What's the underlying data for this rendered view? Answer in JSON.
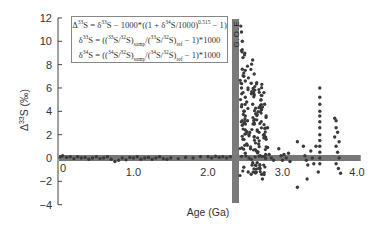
{
  "chart_data": {
    "type": "scatter",
    "title": "",
    "xlabel": "Age (Ga)",
    "ylabel": "Δ33S (‰)",
    "xlim": [
      0,
      4.0
    ],
    "ylim": [
      -4,
      12
    ],
    "x_ticks": [
      0,
      1.0,
      2.0,
      3.0
    ],
    "x_tick_labels": [
      "0",
      "1.0",
      "2.0",
      "3.0",
      "4.0"
    ],
    "x_tick_label_positions": [
      0,
      1.0,
      2.0,
      3.0,
      4.0
    ],
    "y_ticks": [
      12,
      10,
      8,
      6,
      4,
      2,
      0,
      -2,
      -4
    ],
    "y_tick_labels": [
      "12",
      "10",
      "8",
      "6",
      "4",
      "2",
      "0",
      "−2",
      "−4"
    ],
    "grid": false,
    "legend": null,
    "annotations": [
      {
        "type": "vertical_band",
        "label": "G.O.E",
        "x_start": 2.33,
        "x_end": 2.42,
        "y_start": 12.0,
        "y_end": -3.8,
        "color": "#7a7a7a"
      },
      {
        "type": "horizontal_band",
        "label": "mass-dependent range",
        "x_start": 0,
        "x_end": 4.05,
        "y_center": 0,
        "thickness": 0.5,
        "color": "#777777"
      }
    ],
    "formulas": [
      "Δ33S = δ33S − 1000*((1 + δ34S/1000)^0.515 − 1)",
      "δ33S = ((33S/32S)samp/(33S/32S)ref − 1)*1000",
      "δ34S = ((34S/32S)samp/(34S/32S)ref − 1)*1000"
    ],
    "series": [
      {
        "name": "Δ33S measurements",
        "color": "#3a3a3a",
        "points": [
          [
            0.02,
            0.1
          ],
          [
            0.05,
            0.2
          ],
          [
            0.1,
            0.05
          ],
          [
            0.15,
            0.1
          ],
          [
            0.2,
            -0.05
          ],
          [
            0.25,
            0.1
          ],
          [
            0.3,
            0.0
          ],
          [
            0.35,
            0.05
          ],
          [
            0.4,
            -0.1
          ],
          [
            0.45,
            0.0
          ],
          [
            0.5,
            0.1
          ],
          [
            0.55,
            -0.05
          ],
          [
            0.6,
            0.0
          ],
          [
            0.65,
            0.1
          ],
          [
            0.7,
            -0.1
          ],
          [
            0.75,
            -0.3
          ],
          [
            0.8,
            -0.2
          ],
          [
            0.85,
            0.0
          ],
          [
            0.9,
            -0.15
          ],
          [
            0.95,
            0.05
          ],
          [
            1.0,
            0.0
          ],
          [
            1.05,
            0.1
          ],
          [
            1.1,
            -0.1
          ],
          [
            1.15,
            0.0
          ],
          [
            1.2,
            0.05
          ],
          [
            1.25,
            -0.1
          ],
          [
            1.3,
            0.0
          ],
          [
            1.35,
            0.1
          ],
          [
            1.4,
            -0.05
          ],
          [
            1.45,
            -0.1
          ],
          [
            1.5,
            0.0
          ],
          [
            1.6,
            -0.05
          ],
          [
            1.7,
            0.05
          ],
          [
            1.8,
            0.0
          ],
          [
            1.9,
            0.1
          ],
          [
            2.0,
            0.1
          ],
          [
            2.05,
            0.0
          ],
          [
            2.1,
            0.15
          ],
          [
            2.15,
            0.05
          ],
          [
            2.2,
            0.1
          ],
          [
            2.25,
            0.0
          ],
          [
            2.3,
            0.1
          ],
          [
            2.44,
            11.3
          ],
          [
            2.45,
            10.8
          ],
          [
            2.46,
            10.0
          ],
          [
            2.45,
            9.2
          ],
          [
            2.47,
            8.6
          ],
          [
            2.46,
            7.6
          ],
          [
            2.48,
            7.0
          ],
          [
            2.5,
            6.6
          ],
          [
            2.45,
            6.0
          ],
          [
            2.47,
            5.6
          ],
          [
            2.5,
            5.2
          ],
          [
            2.52,
            4.8
          ],
          [
            2.45,
            4.4
          ],
          [
            2.48,
            4.0
          ],
          [
            2.5,
            3.6
          ],
          [
            2.53,
            3.2
          ],
          [
            2.46,
            2.8
          ],
          [
            2.5,
            2.4
          ],
          [
            2.55,
            2.0
          ],
          [
            2.47,
            1.6
          ],
          [
            2.52,
            1.2
          ],
          [
            2.57,
            0.8
          ],
          [
            2.5,
            0.4
          ],
          [
            2.55,
            0.0
          ],
          [
            2.6,
            -0.4
          ],
          [
            2.48,
            -0.8
          ],
          [
            2.54,
            -1.2
          ],
          [
            2.58,
            -1.4
          ],
          [
            2.6,
            8.4
          ],
          [
            2.62,
            7.2
          ],
          [
            2.58,
            6.4
          ],
          [
            2.62,
            5.4
          ],
          [
            2.6,
            4.6
          ],
          [
            2.64,
            3.8
          ],
          [
            2.62,
            3.0
          ],
          [
            2.66,
            2.4
          ],
          [
            2.62,
            1.8
          ],
          [
            2.68,
            1.2
          ],
          [
            2.65,
            0.6
          ],
          [
            2.7,
            0.2
          ],
          [
            2.66,
            -0.4
          ],
          [
            2.7,
            -0.9
          ],
          [
            2.72,
            -1.4
          ],
          [
            2.73,
            -1.8
          ],
          [
            2.75,
            5.6
          ],
          [
            2.76,
            4.6
          ],
          [
            2.78,
            3.6
          ],
          [
            2.8,
            2.6
          ],
          [
            2.78,
            1.6
          ],
          [
            2.8,
            0.9
          ],
          [
            2.82,
            0.3
          ],
          [
            2.85,
            0.0
          ],
          [
            2.88,
            -0.2
          ],
          [
            2.95,
            0.8
          ],
          [
            2.98,
            0.2
          ],
          [
            3.0,
            -0.2
          ],
          [
            3.02,
            0.3
          ],
          [
            3.05,
            0.0
          ],
          [
            3.08,
            0.4
          ],
          [
            3.1,
            -0.3
          ],
          [
            3.2,
            1.4
          ],
          [
            3.28,
            1.0
          ],
          [
            3.3,
            0.2
          ],
          [
            3.32,
            -0.2
          ],
          [
            3.34,
            -0.6
          ],
          [
            3.38,
            0.6
          ],
          [
            3.4,
            0.0
          ],
          [
            3.42,
            -0.5
          ],
          [
            3.45,
            1.0
          ],
          [
            3.5,
            6.0
          ],
          [
            3.5,
            5.2
          ],
          [
            3.5,
            4.6
          ],
          [
            3.5,
            4.0
          ],
          [
            3.5,
            3.6
          ],
          [
            3.5,
            3.1
          ],
          [
            3.5,
            2.6
          ],
          [
            3.5,
            2.0
          ],
          [
            3.5,
            1.5
          ],
          [
            3.5,
            1.0
          ],
          [
            3.5,
            0.5
          ],
          [
            3.5,
            0.0
          ],
          [
            3.5,
            -0.5
          ],
          [
            3.48,
            -1.2
          ],
          [
            3.33,
            -1.8
          ],
          [
            3.2,
            -2.5
          ],
          [
            3.7,
            3.4
          ],
          [
            3.72,
            3.2
          ],
          [
            3.72,
            2.6
          ],
          [
            3.74,
            2.2
          ],
          [
            3.7,
            1.8
          ],
          [
            3.76,
            1.4
          ],
          [
            3.72,
            1.0
          ],
          [
            3.74,
            0.5
          ],
          [
            3.76,
            0.0
          ],
          [
            3.72,
            -0.5
          ],
          [
            3.75,
            -0.9
          ],
          [
            3.78,
            -1.3
          ]
        ]
      }
    ]
  },
  "labels": {
    "xlabel": "Age (Ga)",
    "ylabel_main": "Δ",
    "ylabel_sup": "33",
    "ylabel_rest": "S (‰)",
    "goe": "G.O.E"
  }
}
